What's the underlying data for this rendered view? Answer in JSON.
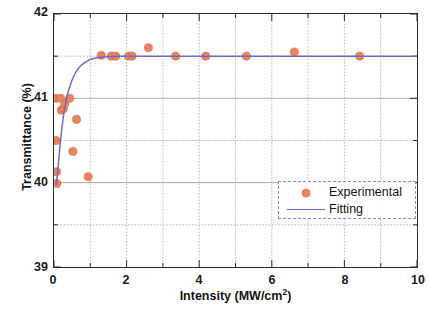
{
  "chart_data": {
    "type": "scatter",
    "title": "",
    "xlabel": "Intensity (MW/cm2)",
    "xlabel_base": "Intensity (MW/cm",
    "xlabel_sup": "2",
    "xlabel_tail": ")",
    "ylabel": "Transmittance (%)",
    "xlim": [
      0,
      10
    ],
    "ylim": [
      39,
      42
    ],
    "xticks": [
      0,
      2,
      4,
      6,
      8,
      10
    ],
    "xtick_labels": [
      "0",
      "2",
      "4",
      "6",
      "8",
      "10"
    ],
    "xminor_ticks": [
      1,
      3,
      5,
      7,
      9
    ],
    "yticks": [
      39,
      40,
      41,
      42
    ],
    "ytick_labels": [
      "39",
      "40",
      "41",
      "42"
    ],
    "ygrid_values": [
      39.5,
      40,
      40.5,
      41,
      41.5
    ],
    "xgrid_values": [
      1,
      2,
      3,
      4,
      5,
      6,
      7,
      8,
      9
    ],
    "grid": true,
    "grid_color": "#9a9a9a",
    "frame_color": "#2b2b2b",
    "legend_position": "lower right",
    "series": [
      {
        "name": "Experimental",
        "type": "scatter",
        "marker": "circle",
        "color": "#ee7f55",
        "points": [
          {
            "x": 0.04,
            "y": 41.0
          },
          {
            "x": 0.06,
            "y": 40.5
          },
          {
            "x": 0.07,
            "y": 40.13
          },
          {
            "x": 0.08,
            "y": 39.99
          },
          {
            "x": 0.18,
            "y": 41.0
          },
          {
            "x": 0.2,
            "y": 40.86
          },
          {
            "x": 0.26,
            "y": 40.88
          },
          {
            "x": 0.3,
            "y": 40.94
          },
          {
            "x": 0.43,
            "y": 41.0
          },
          {
            "x": 0.52,
            "y": 40.37
          },
          {
            "x": 0.62,
            "y": 40.75
          },
          {
            "x": 0.94,
            "y": 40.07
          },
          {
            "x": 1.3,
            "y": 41.51
          },
          {
            "x": 1.58,
            "y": 41.5
          },
          {
            "x": 1.7,
            "y": 41.5
          },
          {
            "x": 2.05,
            "y": 41.5
          },
          {
            "x": 2.15,
            "y": 41.5
          },
          {
            "x": 2.6,
            "y": 41.6
          },
          {
            "x": 3.35,
            "y": 41.5
          },
          {
            "x": 4.18,
            "y": 41.5
          },
          {
            "x": 5.3,
            "y": 41.5
          },
          {
            "x": 6.62,
            "y": 41.55
          },
          {
            "x": 8.42,
            "y": 41.5
          }
        ]
      },
      {
        "name": "Fitting",
        "type": "line",
        "color": "#6a6acc",
        "model": "saturating",
        "points": [
          {
            "x": 0.06,
            "y": 39.98
          },
          {
            "x": 0.09,
            "y": 40.08
          },
          {
            "x": 0.12,
            "y": 40.22
          },
          {
            "x": 0.15,
            "y": 40.36
          },
          {
            "x": 0.18,
            "y": 40.5
          },
          {
            "x": 0.215,
            "y": 40.64
          },
          {
            "x": 0.25,
            "y": 40.76
          },
          {
            "x": 0.29,
            "y": 40.87
          },
          {
            "x": 0.33,
            "y": 40.96
          },
          {
            "x": 0.375,
            "y": 41.05
          },
          {
            "x": 0.42,
            "y": 41.12
          },
          {
            "x": 0.475,
            "y": 41.19
          },
          {
            "x": 0.53,
            "y": 41.25
          },
          {
            "x": 0.6,
            "y": 41.31
          },
          {
            "x": 0.68,
            "y": 41.36
          },
          {
            "x": 0.77,
            "y": 41.4
          },
          {
            "x": 0.87,
            "y": 41.43
          },
          {
            "x": 0.99,
            "y": 41.46
          },
          {
            "x": 1.12,
            "y": 41.475
          },
          {
            "x": 1.28,
            "y": 41.487
          },
          {
            "x": 1.48,
            "y": 41.494
          },
          {
            "x": 1.75,
            "y": 41.498
          },
          {
            "x": 2.1,
            "y": 41.5
          },
          {
            "x": 3.0,
            "y": 41.5
          },
          {
            "x": 5.0,
            "y": 41.5
          },
          {
            "x": 7.5,
            "y": 41.5
          },
          {
            "x": 10.0,
            "y": 41.5
          }
        ]
      }
    ]
  },
  "legend": {
    "items": [
      {
        "label": "Experimental",
        "key": "marker-dot",
        "color": "#ee7f55"
      },
      {
        "label": "Fitting",
        "key": "line-segment",
        "color": "#6a6acc"
      }
    ]
  }
}
